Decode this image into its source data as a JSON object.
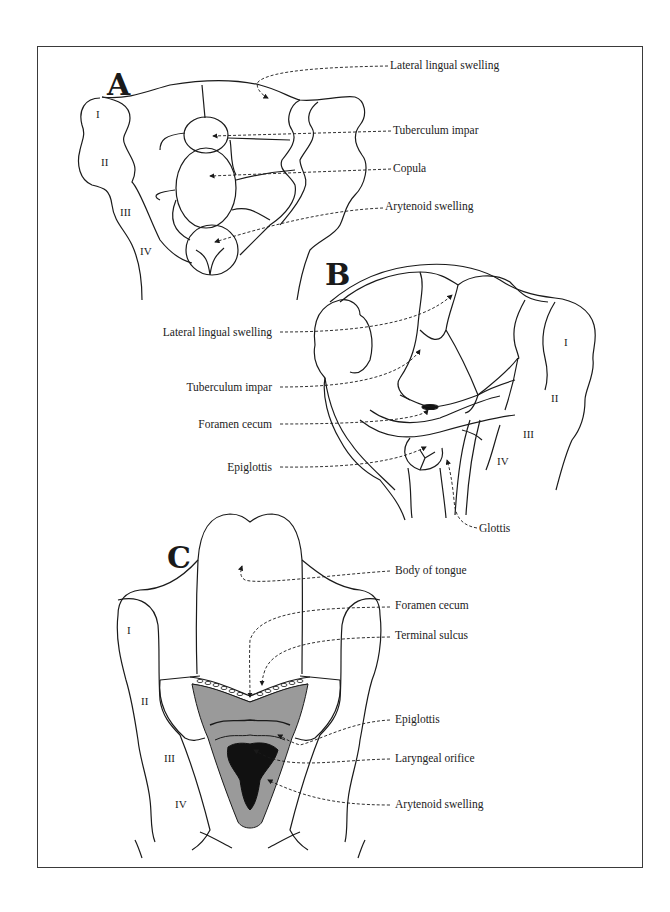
{
  "figure": {
    "panels": [
      {
        "id": "A",
        "letter": "A",
        "labels": [
          {
            "text": "Lateral lingual swelling",
            "x": 390,
            "y": 66
          },
          {
            "text": "Tuberculum impar",
            "x": 393,
            "y": 130
          },
          {
            "text": "Copula",
            "x": 393,
            "y": 168
          },
          {
            "text": "Arytenoid swelling",
            "x": 385,
            "y": 207
          }
        ],
        "arches": [
          {
            "text": "I",
            "x": 96,
            "y": 114
          },
          {
            "text": "II",
            "x": 101,
            "y": 162
          },
          {
            "text": "III",
            "x": 120,
            "y": 212
          },
          {
            "text": "IV",
            "x": 140,
            "y": 250
          }
        ]
      },
      {
        "id": "B",
        "letter": "B",
        "labels": [
          {
            "text": "Lateral lingual swelling",
            "x": 272,
            "y": 328,
            "align": "right"
          },
          {
            "text": "Tuberculum impar",
            "x": 272,
            "y": 383,
            "align": "right"
          },
          {
            "text": "Foramen cecum",
            "x": 272,
            "y": 420,
            "align": "right"
          },
          {
            "text": "Epiglottis",
            "x": 272,
            "y": 463,
            "align": "right"
          },
          {
            "text": "Glottis",
            "x": 479,
            "y": 527
          }
        ],
        "arches": [
          {
            "text": "I",
            "x": 564,
            "y": 341
          },
          {
            "text": "II",
            "x": 551,
            "y": 397
          },
          {
            "text": "III",
            "x": 523,
            "y": 433
          },
          {
            "text": "IV",
            "x": 497,
            "y": 460
          }
        ]
      },
      {
        "id": "C",
        "letter": "C",
        "labels": [
          {
            "text": "Body of tongue",
            "x": 395,
            "y": 567
          },
          {
            "text": "Foramen cecum",
            "x": 395,
            "y": 602
          },
          {
            "text": "Terminal sulcus",
            "x": 395,
            "y": 632
          },
          {
            "text": "Epiglottis",
            "x": 395,
            "y": 716
          },
          {
            "text": "Laryngeal orifice",
            "x": 395,
            "y": 755
          },
          {
            "text": "Arytenoid swelling",
            "x": 395,
            "y": 801
          }
        ],
        "arches": [
          {
            "text": "I",
            "x": 127,
            "y": 630
          },
          {
            "text": "II",
            "x": 141,
            "y": 700
          },
          {
            "text": "III",
            "x": 164,
            "y": 757
          },
          {
            "text": "IV",
            "x": 175,
            "y": 803
          }
        ]
      }
    ],
    "colors": {
      "line": "#1a1a1a",
      "gray_fill": "#9a9a9a",
      "dark_fill": "#111111",
      "frame": "#3a3a3a"
    }
  }
}
